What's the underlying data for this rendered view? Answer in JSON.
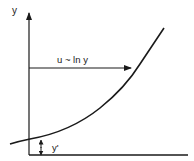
{
  "diagram": {
    "axis_label_y": "y",
    "arrow_label": "u ~ ln y",
    "offset_label": "y'",
    "colors": {
      "ink": "#1a1a1a",
      "background": "#ffffff"
    }
  }
}
